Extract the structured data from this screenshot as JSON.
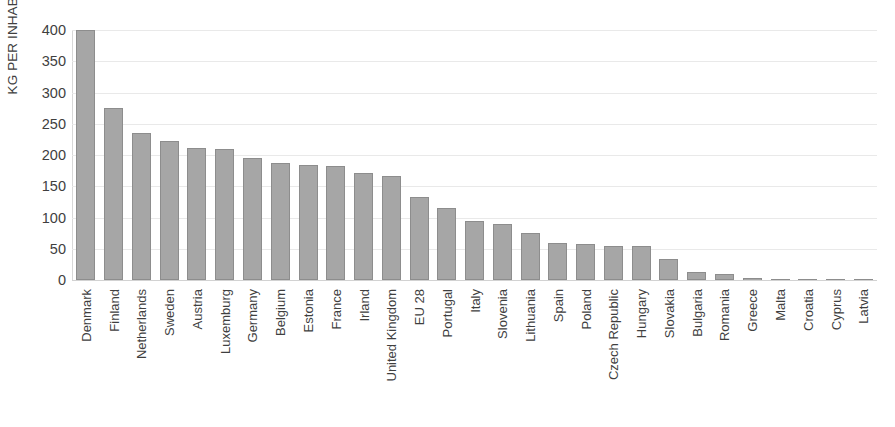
{
  "chart_data": {
    "type": "bar",
    "title": "",
    "subtitle": "",
    "xlabel": "",
    "ylabel": "KG PER INHABITANTS",
    "ylim": [
      0,
      400
    ],
    "ytick_step": 50,
    "yticks": [
      "400",
      "350",
      "300",
      "250",
      "200",
      "150",
      "100",
      "50",
      "0"
    ],
    "grid": true,
    "legend": "none",
    "bar_color": "#a6a6a6",
    "bar_border_color": "#8d8d8d",
    "gridline_color": "#e9e9e9",
    "categories": [
      "Denmark",
      "Finland",
      "Netherlands",
      "Sweden",
      "Austria",
      "Luxemburg",
      "Germany",
      "Belgium",
      "Estonia",
      "France",
      "Irland",
      "United Kingdom",
      "EU 28",
      "Portugal",
      "Italy",
      "Slovenia",
      "Lithuania",
      "Spain",
      "Poland",
      "Czech Republic",
      "Hungary",
      "Slovakia",
      "Bulgaria",
      "Romania",
      "Greece",
      "Malta",
      "Croatia",
      "Cyprus",
      "Latvia"
    ],
    "values": [
      400,
      275,
      235,
      222,
      212,
      210,
      195,
      188,
      184,
      183,
      171,
      167,
      133,
      115,
      95,
      89,
      76,
      60,
      58,
      55,
      55,
      34,
      13,
      9,
      3,
      2,
      0.5,
      0.3,
      0.2
    ]
  }
}
